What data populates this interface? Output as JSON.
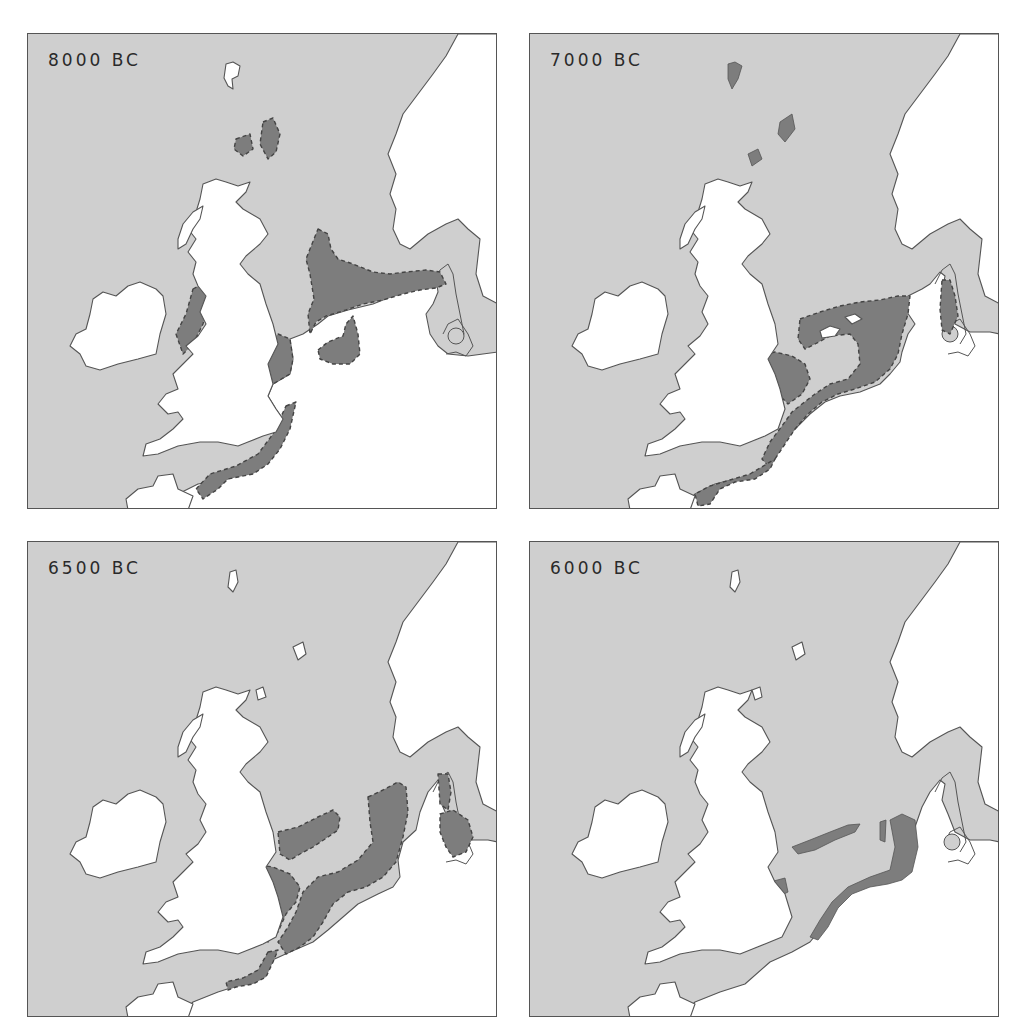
{
  "figure": {
    "type": "paleogeographic map series",
    "region": "North Sea / Doggerland",
    "colors": {
      "sea": "#cfcfcf",
      "land": "#ffffff",
      "exposed_land": "#7d7d7d",
      "coastline": "#555555",
      "label_text": "#2a2a2a"
    },
    "panels": [
      {
        "id": "p8000",
        "label": "8000 BC"
      },
      {
        "id": "p7000",
        "label": "7000 BC"
      },
      {
        "id": "p6500",
        "label": "6500 BC"
      },
      {
        "id": "p6000",
        "label": "6000 BC"
      }
    ]
  }
}
